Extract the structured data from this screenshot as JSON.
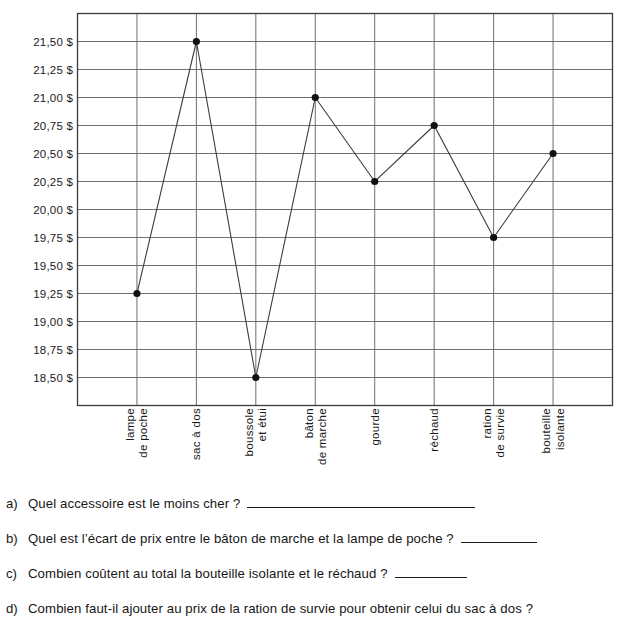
{
  "chart_data": {
    "type": "line",
    "title": "",
    "xlabel": "",
    "ylabel": "",
    "categories": [
      "lampe de poche",
      "sac à dos",
      "boussole et étui",
      "bâton de marche",
      "gourde",
      "réchaud",
      "ration de survie",
      "bouteille isolante"
    ],
    "category_lines": [
      [
        "lampe",
        "de poche"
      ],
      [
        "sac à dos"
      ],
      [
        "boussole",
        "et étui"
      ],
      [
        "bâton",
        "de marche"
      ],
      [
        "gourde"
      ],
      [
        "réchaud"
      ],
      [
        "ration",
        "de survie"
      ],
      [
        "bouteille",
        "isolante"
      ]
    ],
    "values": [
      19.25,
      21.5,
      18.5,
      21.0,
      20.25,
      20.75,
      19.75,
      20.5
    ],
    "value_labels": [
      "19,25 $",
      "21,50 $",
      "18,50 $",
      "21,00 $",
      "20,25 $",
      "20,75 $",
      "19,75 $",
      "20,50 $"
    ],
    "ylim": [
      18.375,
      21.625
    ],
    "yticks": [
      21.5,
      21.25,
      21.0,
      20.75,
      20.5,
      20.25,
      20.0,
      19.75,
      19.5,
      19.25,
      19.0,
      18.75,
      18.5
    ],
    "ytick_labels": [
      "21,50 $",
      "21,25 $",
      "21,00 $",
      "20,75 $",
      "20,50 $",
      "20,25 $",
      "20,00 $",
      "19,75 $",
      "19,50 $",
      "19,25 $",
      "19,00 $",
      "18,75 $",
      "18,50 $"
    ],
    "grid": true,
    "legend": "none",
    "currency": "$",
    "decimal_separator": ",",
    "colors": {
      "line": "#3c3c3c",
      "marker": "#111111",
      "grid": "#6e6e6e",
      "axis": "#3a3a3a",
      "background": "#ffffff"
    }
  },
  "questions": [
    {
      "marker": "a)",
      "text": "Quel accessoire est le moins cher ?",
      "blank": "long"
    },
    {
      "marker": "b)",
      "text": "Quel est l’écart de prix entre le bâton de marche et la lampe de poche ?",
      "blank": "short"
    },
    {
      "marker": "c)",
      "text": "Combien coûtent au total la bouteille isolante et le réchaud ?",
      "blank": "med"
    },
    {
      "marker": "d)",
      "text": "Combien faut-il ajouter au prix de la ration de survie pour obtenir celui du sac à dos ?",
      "blank": "none"
    }
  ]
}
